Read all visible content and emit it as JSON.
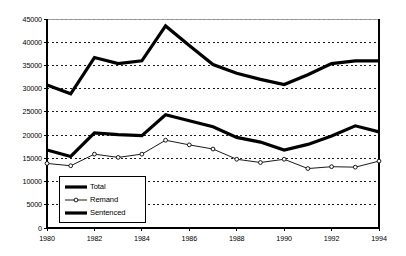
{
  "chart_data": {
    "type": "line",
    "title": "",
    "subtitle": "",
    "xlabel": "",
    "ylabel": "",
    "x": [
      1980,
      1981,
      1982,
      1983,
      1984,
      1985,
      1986,
      1987,
      1988,
      1989,
      1990,
      1991,
      1992,
      1993,
      1994
    ],
    "xlim": [
      1980,
      1994
    ],
    "ylim": [
      0,
      45000
    ],
    "grid": true,
    "grid_style": "dotted-horizontal",
    "legend_position": "lower-left-inside",
    "xtick_labels": [
      "1980",
      "1982",
      "1984",
      "1986",
      "1988",
      "1990",
      "1992",
      "1994"
    ],
    "xtick_values": [
      1980,
      1982,
      1984,
      1986,
      1988,
      1990,
      1992,
      1994
    ],
    "ytick_labels": [
      "0",
      "5000",
      "10000",
      "15000",
      "20000",
      "25000",
      "30000",
      "35000",
      "40000",
      "45000"
    ],
    "ytick_values": [
      0,
      5000,
      10000,
      15000,
      20000,
      25000,
      30000,
      35000,
      40000,
      45000
    ],
    "series": [
      {
        "name": "Total",
        "color": "#000000",
        "line_width": 3.2,
        "marker": "none",
        "values": [
          30800,
          28900,
          36700,
          35400,
          36000,
          43500,
          39300,
          35200,
          33300,
          32000,
          30900,
          33000,
          35400,
          36000,
          36000
        ]
      },
      {
        "name": "Remand",
        "color": "#000000",
        "line_width": 0.9,
        "marker": "circle",
        "values": [
          13900,
          13400,
          15900,
          15200,
          15900,
          18900,
          17900,
          17000,
          14800,
          14100,
          14800,
          12800,
          13200,
          13100,
          14400
        ]
      },
      {
        "name": "Sentenced",
        "color": "#000000",
        "line_width": 3.2,
        "marker": "none",
        "values": [
          16800,
          15400,
          20500,
          20100,
          19900,
          24400,
          23100,
          21800,
          19500,
          18500,
          16800,
          18000,
          19800,
          22000,
          20700
        ]
      }
    ]
  },
  "legend": {
    "items": [
      {
        "label": "Total",
        "marker": "thick-line"
      },
      {
        "label": "Remand",
        "marker": "thin-line-circle"
      },
      {
        "label": "Sentenced",
        "marker": "thick-line"
      }
    ]
  },
  "axes": {
    "y_axis_name": "y-axis",
    "x_axis_name": "x-axis"
  }
}
